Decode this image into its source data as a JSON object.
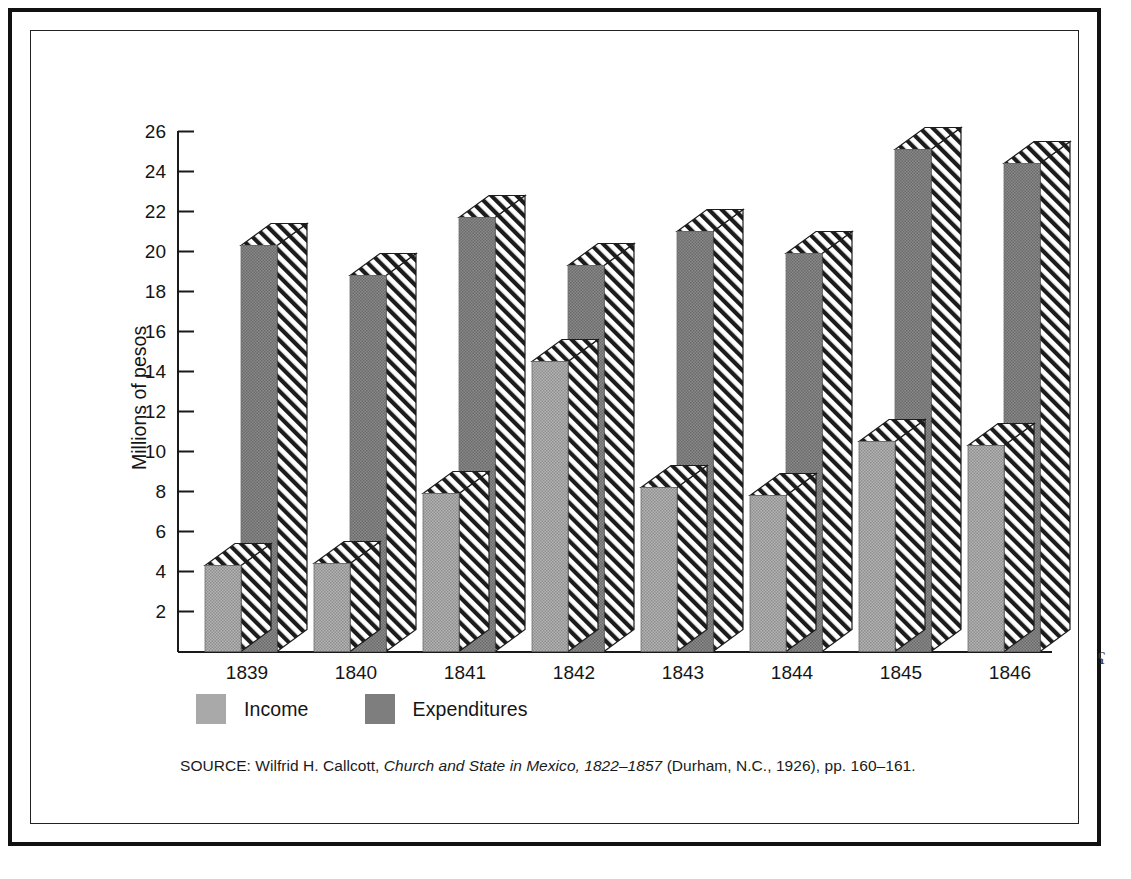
{
  "figure": {
    "y_axis_title": "Millions of pesos",
    "source_prefix": "SOURCE: Wilfrid H. Callcott, ",
    "source_italic": "Church and State in Mexico, 1822–1857",
    "source_suffix": " (Durham, N.C., 1926), pp. 160–161.",
    "source_full": "SOURCE: Wilfrid H. Callcott, Church and State in Mexico, 1822–1857 (Durham, N.C., 1926), pp. 160–161.",
    "edge_mark": "ʕ"
  },
  "legend": {
    "position": "bottom-left",
    "entries": [
      {
        "label": "Income",
        "color": "#a9a9a9"
      },
      {
        "label": "Expenditures",
        "color": "#7e7e7e"
      }
    ]
  },
  "colors": {
    "income_fill": "#a9a9a9",
    "expenditures_fill": "#7e7e7e",
    "hatch_line": "#1c1c1c",
    "hatch_bg": "#ffffff",
    "axis": "#1a1a1a",
    "frame_outer": "#111111",
    "frame_inner": "#222222",
    "text": "#151515",
    "page_bg": "#ffffff"
  },
  "chart_data": {
    "type": "bar",
    "title": "",
    "subtitle": "",
    "xlabel": "",
    "ylabel": "Millions of pesos",
    "ylim": [
      0,
      26
    ],
    "ytick_step": 2,
    "yticks": [
      2,
      4,
      6,
      8,
      10,
      12,
      14,
      16,
      18,
      20,
      22,
      24,
      26
    ],
    "ytick_labels": [
      "2",
      "4",
      "6",
      "8",
      "10",
      "12",
      "14",
      "16",
      "18",
      "20",
      "22",
      "24",
      "26"
    ],
    "categories": [
      "1839",
      "1840",
      "1841",
      "1842",
      "1843",
      "1844",
      "1845",
      "1846"
    ],
    "grid": false,
    "legend_position": "bottom-left",
    "bar_style": "3d-extruded-with-diagonal-hatch-top-and-side",
    "series": [
      {
        "name": "Income",
        "color": "#a9a9a9",
        "values": [
          4.3,
          4.4,
          7.9,
          14.5,
          8.2,
          7.8,
          10.5,
          10.3
        ]
      },
      {
        "name": "Expenditures",
        "color": "#7e7e7e",
        "values": [
          20.3,
          18.8,
          21.7,
          19.3,
          21.0,
          19.9,
          25.1,
          24.4
        ]
      }
    ]
  }
}
